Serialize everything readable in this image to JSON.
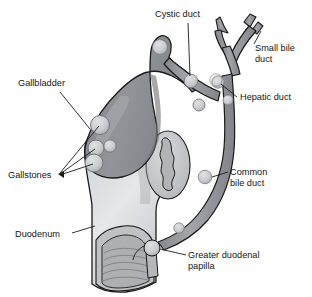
{
  "figure": {
    "background_color": "#ffffff",
    "line_color": "#1a1a1a",
    "label_color": "#141414"
  },
  "palette": {
    "gallbladder_fill": "#8f9095",
    "gallbladder_shade": "#74757b",
    "gallbladder_highlight": "#a8a9ad",
    "duct_fill": "#9a9b9f",
    "duct_shade": "#7b7c81",
    "duodenum_fill": "#c9cacd",
    "duodenum_shade": "#adaeb2",
    "duodenum_highlight": "#e2e3e5",
    "stone_fill": "#cfd0d3",
    "stone_shade": "#b0b1b5",
    "lumen_fill": "#b5b6ba",
    "fold_line": "#8c8d91"
  },
  "labels": [
    {
      "id": "cystic-duct",
      "text": "Cystic duct",
      "lines": [
        "Cystic duct"
      ],
      "x": 155,
      "y": 17,
      "anchor": "start"
    },
    {
      "id": "small-bile-duct",
      "text": "Small bile duct",
      "lines": [
        "Small bile",
        "duct"
      ],
      "x": 255,
      "y": 51,
      "anchor": "start"
    },
    {
      "id": "hepatic-duct",
      "text": "Hepatic duct",
      "lines": [
        "Hepatic duct"
      ],
      "x": 240,
      "y": 100,
      "anchor": "start"
    },
    {
      "id": "common-bile-duct",
      "text": "Common bile duct",
      "lines": [
        "Common",
        "bile duct"
      ],
      "x": 230,
      "y": 175,
      "anchor": "start"
    },
    {
      "id": "greater-duodenal-papilla",
      "text": "Greater duodenal papilla",
      "lines": [
        "Greater duodenal",
        "papilla"
      ],
      "x": 188,
      "y": 258,
      "anchor": "start"
    },
    {
      "id": "gallbladder",
      "text": "Gallbladder",
      "lines": [
        "Gallbladder"
      ],
      "x": 18,
      "y": 86,
      "anchor": "start"
    },
    {
      "id": "gallstones",
      "text": "Gallstones",
      "lines": [
        "Gallstones"
      ],
      "x": 8,
      "y": 175,
      "anchor": "start"
    },
    {
      "id": "duodenum",
      "text": "Duodenum",
      "lines": [
        "Duodenum"
      ],
      "x": 15,
      "y": 237,
      "anchor": "start"
    }
  ],
  "structures": [
    {
      "id": "gallbladder",
      "name": "Gallbladder"
    },
    {
      "id": "cystic-duct",
      "name": "Cystic duct"
    },
    {
      "id": "hepatic-duct",
      "name": "Hepatic duct"
    },
    {
      "id": "small-bile-duct",
      "name": "Small bile duct"
    },
    {
      "id": "common-bile-duct",
      "name": "Common bile duct"
    },
    {
      "id": "duodenum",
      "name": "Duodenum"
    },
    {
      "id": "greater-duodenal-papilla",
      "name": "Greater duodenal papilla"
    }
  ],
  "gallstones": {
    "count_in_gallbladder": 3,
    "count_in_ducts": 6,
    "note": "Gallstones shown as pale rounded nodules in the gallbladder lumen and along the cystic, hepatic and common bile ducts"
  }
}
